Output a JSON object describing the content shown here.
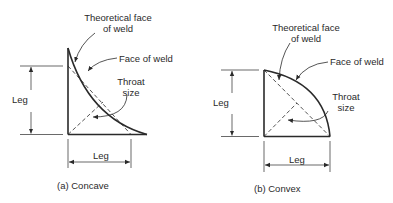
{
  "diagrams": [
    {
      "id": "concave",
      "caption": "(a)  Concave",
      "labels": {
        "theoretical_face_line1": "Theoretical face",
        "theoretical_face_line2": "of weld",
        "face_of_weld": "Face of weld",
        "throat_line1": "Throat",
        "throat_line2": "size",
        "leg_vertical": "Leg",
        "leg_horizontal": "Leg"
      }
    },
    {
      "id": "convex",
      "caption": "(b)  Convex",
      "labels": {
        "theoretical_face_line1": "Theoretical face",
        "theoretical_face_line2": "of weld",
        "face_of_weld": "Face of weld",
        "throat_line1": "Throat",
        "throat_line2": "size",
        "leg_vertical": "Leg",
        "leg_horizontal": "Leg"
      }
    }
  ],
  "colors": {
    "stroke": "#2a2a2a",
    "background": "#ffffff"
  }
}
